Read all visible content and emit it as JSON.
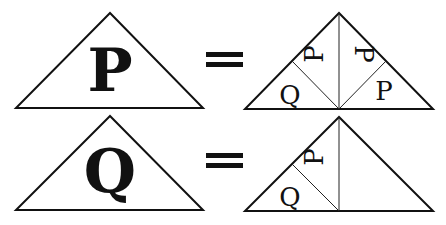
{
  "diagram": {
    "rows": [
      {
        "left": {
          "letter": "P"
        },
        "operator": "=",
        "right": {
          "pieces": [
            {
              "letter": "Q",
              "position": "left-outer",
              "rotation": 0
            },
            {
              "letter": "P",
              "position": "left-inner",
              "rotation": -90
            },
            {
              "letter": "P",
              "position": "right-inner",
              "rotation": 90
            },
            {
              "letter": "P",
              "position": "right-outer",
              "rotation": 0
            }
          ]
        }
      },
      {
        "left": {
          "letter": "Q"
        },
        "operator": "=",
        "right": {
          "pieces": [
            {
              "letter": "Q",
              "position": "left-outer",
              "rotation": 0
            },
            {
              "letter": "P",
              "position": "left-inner",
              "rotation": -90
            }
          ],
          "right_half": "empty"
        }
      }
    ],
    "colors": {
      "line": "#111111",
      "background": "#ffffff"
    }
  }
}
